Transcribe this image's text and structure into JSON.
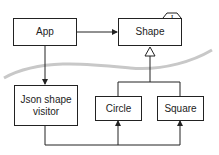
{
  "diagram": {
    "nodes": {
      "app": "App",
      "shape": "Shape",
      "json_visitor": "Json shape visitor",
      "circle": "Circle",
      "square": "Square"
    },
    "interface_marker": "I",
    "colors": {
      "line": "#222222",
      "swoosh": "#c8c8c8",
      "background": "#ffffff"
    }
  }
}
